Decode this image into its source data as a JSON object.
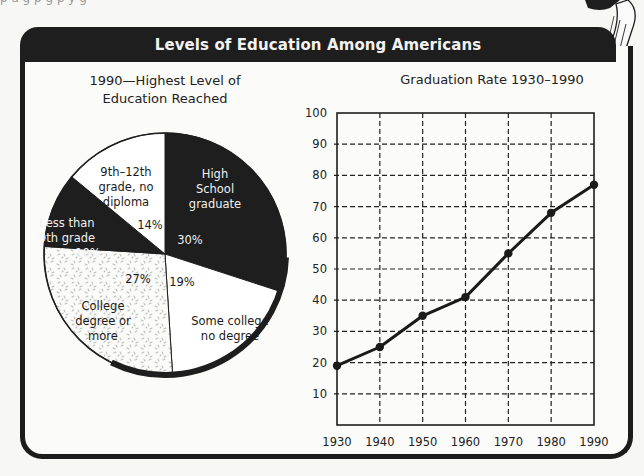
{
  "page": {
    "top_fragment": "p      a                    g  p                 g  p                              y    g"
  },
  "header": {
    "title": "Levels of Education Among Americans"
  },
  "colors": {
    "dark": "#1e1e1e",
    "light": "#ffffff",
    "speckle": "#c8c8c8",
    "grid": "#222222",
    "line": "#1a1a1a"
  },
  "chart_data": [
    {
      "type": "pie",
      "title": "1990—Highest Level of Education Reached",
      "title_lines": [
        "1990—Highest Level of",
        "Education Reached"
      ],
      "slices": [
        {
          "label": "High School graduate",
          "label_lines": [
            "High",
            "School",
            "graduate"
          ],
          "value": 30,
          "value_label": "30%",
          "fill": "dark"
        },
        {
          "label": "Some college no degree",
          "label_lines": [
            "Some college",
            "no degree"
          ],
          "value": 19,
          "value_label": "19%",
          "fill": "light"
        },
        {
          "label": "College degree or more",
          "label_lines": [
            "College",
            "degree or",
            "more"
          ],
          "value": 27,
          "value_label": "27%",
          "fill": "speckled"
        },
        {
          "label": "Less than 9th grade",
          "label_lines": [
            "Less than",
            "9th grade"
          ],
          "value": 10,
          "value_label": "10%",
          "fill": "dark"
        },
        {
          "label": "9th–12th grade, no diploma",
          "label_lines": [
            "9th–12th",
            "grade, no",
            "diploma"
          ],
          "value": 14,
          "value_label": "14%",
          "fill": "light"
        }
      ]
    },
    {
      "type": "line",
      "title": "Graduation Rate 1930–1990",
      "xlabel": "",
      "ylabel": "",
      "x": [
        1930,
        1940,
        1950,
        1960,
        1970,
        1980,
        1990
      ],
      "x_tick_labels": [
        "1930",
        "1940",
        "1950",
        "1960",
        "1970",
        "1980",
        "1990"
      ],
      "y_tick_labels": [
        "100",
        "90",
        "80",
        "70",
        "60",
        "50",
        "40",
        "30",
        "20",
        "10"
      ],
      "ylim": [
        0,
        100
      ],
      "grid": true,
      "grid_style": "dashed",
      "series": [
        {
          "name": "Graduation Rate",
          "values": [
            19,
            25,
            35,
            41,
            55,
            68,
            77
          ]
        }
      ]
    }
  ]
}
